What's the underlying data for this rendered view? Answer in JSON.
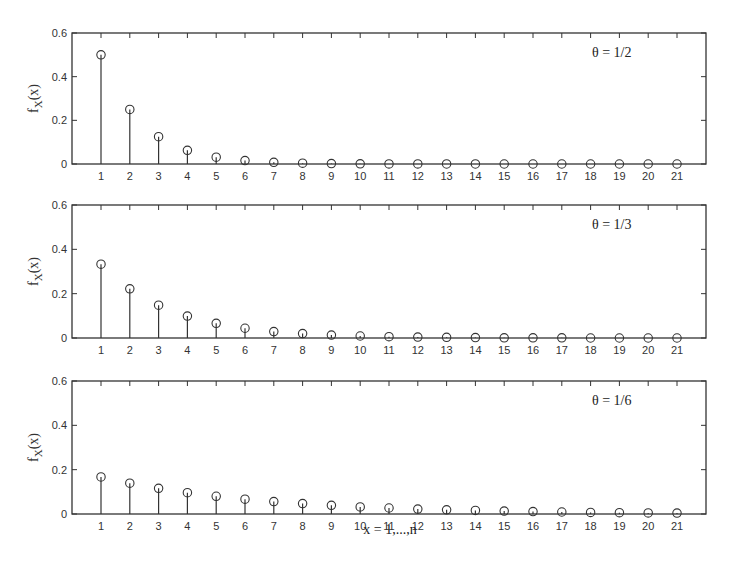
{
  "chart_data": [
    {
      "type": "stem",
      "title": "",
      "annotation": "θ = 1/2",
      "xlabel": "",
      "ylabel": "f_X(x)",
      "ylim": [
        0,
        0.6
      ],
      "yticks": [
        "0",
        "0.2",
        "0.4",
        "0.6"
      ],
      "x": [
        1,
        2,
        3,
        4,
        5,
        6,
        7,
        8,
        9,
        10,
        11,
        12,
        13,
        14,
        15,
        16,
        17,
        18,
        19,
        20,
        21
      ],
      "values": [
        0.5,
        0.25,
        0.125,
        0.0625,
        0.03125,
        0.015625,
        0.0078,
        0.0039,
        0.002,
        0.001,
        0.0005,
        0.0002,
        0.0001,
        0.0001,
        0,
        0,
        0,
        0,
        0,
        0,
        0
      ],
      "grid": false
    },
    {
      "type": "stem",
      "title": "",
      "annotation": "θ = 1/3",
      "xlabel": "",
      "ylabel": "f_X(x)",
      "ylim": [
        0,
        0.6
      ],
      "yticks": [
        "0",
        "0.2",
        "0.4",
        "0.6"
      ],
      "x": [
        1,
        2,
        3,
        4,
        5,
        6,
        7,
        8,
        9,
        10,
        11,
        12,
        13,
        14,
        15,
        16,
        17,
        18,
        19,
        20,
        21
      ],
      "values": [
        0.333,
        0.222,
        0.148,
        0.099,
        0.066,
        0.044,
        0.029,
        0.02,
        0.013,
        0.009,
        0.006,
        0.004,
        0.003,
        0.002,
        0.001,
        0.001,
        0.001,
        0,
        0,
        0,
        0
      ],
      "grid": false
    },
    {
      "type": "stem",
      "title": "",
      "annotation": "θ = 1/6",
      "xlabel": "x = 1,...,n",
      "ylabel": "f_X(x)",
      "ylim": [
        0,
        0.6
      ],
      "yticks": [
        "0",
        "0.2",
        "0.4",
        "0.6"
      ],
      "x": [
        1,
        2,
        3,
        4,
        5,
        6,
        7,
        8,
        9,
        10,
        11,
        12,
        13,
        14,
        15,
        16,
        17,
        18,
        19,
        20,
        21
      ],
      "values": [
        0.167,
        0.139,
        0.116,
        0.096,
        0.08,
        0.067,
        0.056,
        0.047,
        0.039,
        0.032,
        0.027,
        0.022,
        0.019,
        0.016,
        0.013,
        0.011,
        0.009,
        0.007,
        0.006,
        0.005,
        0.004
      ],
      "grid": false
    }
  ],
  "xlabel": "x = 1,...,n"
}
